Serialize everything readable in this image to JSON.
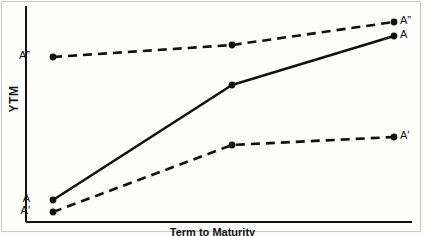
{
  "figure": {
    "type": "line-diagram",
    "background": "#fdfdfc",
    "ink_color": "#111111",
    "border_color": "#c9c9c5"
  },
  "axes": {
    "y_label": "YTM",
    "x_label": "Term to Maturity",
    "y_axis_x": 26,
    "x_axis_y": 222,
    "plot_right": 410
  },
  "labels": {
    "left_top": "A”",
    "left_mid": "A",
    "left_bottom": "A′",
    "right_top": "A”",
    "right_upper": "A",
    "right_lower": "A′"
  },
  "chart_data": {
    "type": "line",
    "title": "",
    "xlabel": "Term to Maturity",
    "ylabel": "YTM",
    "xlim": [
      0,
      100
    ],
    "ylim": [
      0,
      100
    ],
    "grid": false,
    "legend": "none",
    "axis_ticks": false,
    "series": [
      {
        "name": "A”",
        "style": "dashed",
        "label_start": "A”",
        "label_end": "A”",
        "points": [
          {
            "px": 53,
            "py": 57
          },
          {
            "px": 232,
            "py": 45
          },
          {
            "px": 394,
            "py": 22
          }
        ]
      },
      {
        "name": "A",
        "style": "solid",
        "label_start": "A",
        "label_end": "A",
        "points": [
          {
            "px": 53,
            "py": 200
          },
          {
            "px": 232,
            "py": 85
          },
          {
            "px": 394,
            "py": 36
          }
        ]
      },
      {
        "name": "A′",
        "style": "dashed",
        "label_start": "A′",
        "label_end": "A′",
        "points": [
          {
            "px": 53,
            "py": 212
          },
          {
            "px": 232,
            "py": 145
          },
          {
            "px": 394,
            "py": 137
          }
        ]
      }
    ],
    "annotations": [
      {
        "text": "A”",
        "px": 30,
        "py": 57,
        "anchor": "end"
      },
      {
        "text": "A",
        "px": 30,
        "py": 200,
        "anchor": "end"
      },
      {
        "text": "A′",
        "px": 30,
        "py": 212,
        "anchor": "end"
      },
      {
        "text": "A”",
        "px": 400,
        "py": 22,
        "anchor": "start"
      },
      {
        "text": "A",
        "px": 400,
        "py": 36,
        "anchor": "start"
      },
      {
        "text": "A′",
        "px": 400,
        "py": 137,
        "anchor": "start"
      }
    ]
  }
}
